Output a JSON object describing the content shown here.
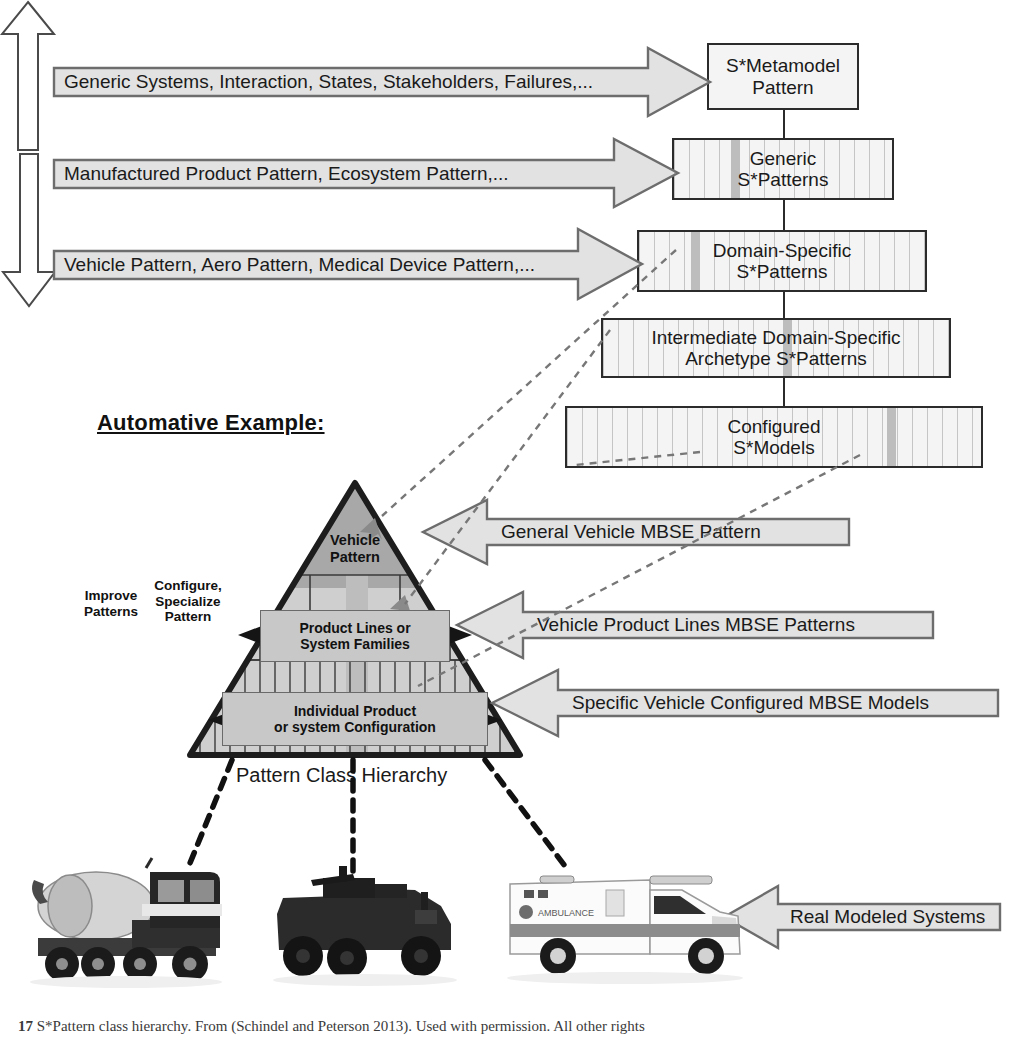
{
  "figure": {
    "heading": "Automative Example:",
    "pattern_class_hierarchy_label": "Pattern Class Hierarchy",
    "caption_number": "17",
    "caption_text": "S*Pattern class hierarchy. From (Schindel and Peterson 2013). Used with permission. All other rights"
  },
  "hierarchy_boxes": [
    {
      "id": "metamodel",
      "label": "S*Metamodel\nPattern"
    },
    {
      "id": "generic",
      "label": "Generic\nS*Patterns"
    },
    {
      "id": "domain",
      "label": "Domain-Specific\nS*Patterns"
    },
    {
      "id": "intermediate",
      "label": "Intermediate Domain-Specific\nArchetype S*Patterns"
    },
    {
      "id": "configured",
      "label": "Configured\nS*Models"
    }
  ],
  "left_arrows": [
    {
      "id": "arrow-metamodel",
      "label": "Generic Systems, Interaction, States, Stakeholders, Failures,..."
    },
    {
      "id": "arrow-generic",
      "label": "Manufactured Product Pattern, Ecosystem Pattern,..."
    },
    {
      "id": "arrow-domain",
      "label": "Vehicle Pattern, Aero Pattern, Medical Device Pattern,..."
    }
  ],
  "right_arrows": [
    {
      "id": "arrow-general-vehicle",
      "label": "General Vehicle MBSE Pattern"
    },
    {
      "id": "arrow-product-lines",
      "label": "Vehicle Product Lines MBSE Patterns"
    },
    {
      "id": "arrow-specific-vehicle",
      "label": "Specific Vehicle Configured MBSE Models"
    },
    {
      "id": "arrow-real-systems",
      "label": "Real Modeled Systems"
    }
  ],
  "pyramid": {
    "apex_label": "Vehicle\nPattern",
    "middle_label": "Product Lines or\nSystem Families",
    "base_label": "Individual Product\nor system Configuration"
  },
  "side_arrows": [
    {
      "id": "improve-patterns",
      "label": "Improve\nPatterns",
      "direction": "up"
    },
    {
      "id": "configure-specialize",
      "label": "Configure,\nSpecialize\nPattern",
      "direction": "down"
    }
  ],
  "vehicles": [
    {
      "id": "cement-mixer-truck",
      "name": "cement mixer truck"
    },
    {
      "id": "armored-military-vehicle",
      "name": "armored military vehicle"
    },
    {
      "id": "ambulance",
      "name": "ambulance",
      "body_text": "AMBULANCE"
    }
  ],
  "colors": {
    "box_fill": "#f4f4f4",
    "box_stroke": "#2b2b2b",
    "arrow_fill": "#e2e2e2",
    "arrow_stroke": "#6d6d6d",
    "apex_fill": "#a8a8a8",
    "mid_fill": "#cfcfcf",
    "inner_box_fill": "#c8c8c8",
    "stripe": "#bdbdbd"
  }
}
